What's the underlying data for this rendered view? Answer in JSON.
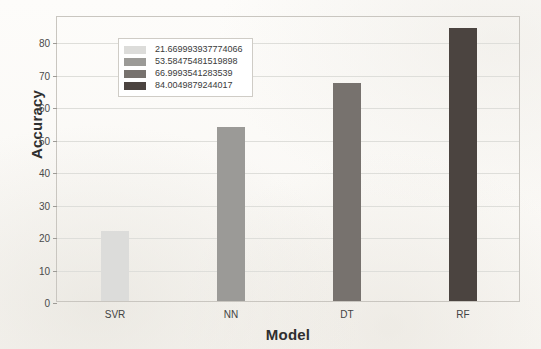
{
  "chart_data": {
    "type": "bar",
    "title": "",
    "xlabel": "Model",
    "ylabel": "Accuracy",
    "categories": [
      "SVR",
      "NN",
      "DT",
      "RF"
    ],
    "values": [
      21.669993937774066,
      53.58475481519898,
      66.9993541283539,
      84.0049879244017
    ],
    "ylim": [
      0,
      88
    ],
    "yticks": [
      0,
      10,
      20,
      30,
      40,
      50,
      60,
      70,
      80
    ],
    "ytick_labels": [
      "0",
      "10",
      "20",
      "30",
      "40",
      "50",
      "60",
      "70",
      "80"
    ],
    "grid": "horizontal",
    "legend_position": "upper-left",
    "bar_colors": [
      "#dcdcda",
      "#9b9a97",
      "#77726e",
      "#4b4440"
    ],
    "legend": [
      {
        "label": "21.669993937774066",
        "color": "#dcdcda"
      },
      {
        "label": "53.58475481519898",
        "color": "#9b9a97"
      },
      {
        "label": "66.9993541283539",
        "color": "#77726e"
      },
      {
        "label": "84.0049879244017",
        "color": "#4b4440"
      }
    ]
  },
  "figure": {
    "frame_color": "#c9c6c0",
    "gridline_color": "#dededa",
    "background_color": "#fbfaf8"
  }
}
